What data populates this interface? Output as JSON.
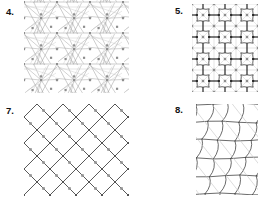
{
  "sheet": {
    "width": 264,
    "height": 197,
    "background": "#ffffff",
    "description": "Four numbered line-drawing tiling pattern figures arranged in a 2x2 grid"
  },
  "colors": {
    "ink": "#3a3a3a",
    "ink_dark": "#1e1e1e",
    "ink_light": "#9a9a9a",
    "ink_faint": "#c4c4c4",
    "dot": "#8e8e8e",
    "dot_dark": "#2a2a2a",
    "label": "#121212",
    "background": "#ffffff"
  },
  "panels": [
    {
      "id": "panel-4",
      "label": "4.",
      "label_x": 6,
      "label_y": 7,
      "figure_x": 24,
      "figure_y": 0,
      "figure_w": 105,
      "figure_h": 93,
      "pattern_type": "triangulated-pinwheel-tiling",
      "period_x": 33,
      "period_y": 31,
      "dot_shape": "square",
      "dot_size": 2.2,
      "notes": "Dense triangulation with pinwheel star vertices, thin light strokes, gray square dots inside larger cells"
    },
    {
      "id": "panel-5",
      "label": "5.",
      "label_x": 175,
      "label_y": 6,
      "figure_x": 192,
      "figure_y": 4,
      "figure_w": 66,
      "figure_h": 88,
      "pattern_type": "scalloped-cross-tiling",
      "period_x": 22,
      "period_y": 22,
      "dot_shape": "square",
      "dot_size": 2.4,
      "notes": "Dark curved scalloped cross tiles over a faint gray square-and-diagonal underlay grid; dark square nodes at cross corners, gray square dots at grid centers"
    },
    {
      "id": "panel-7",
      "label": "7.",
      "label_x": 6,
      "label_y": 106,
      "figure_x": 24,
      "figure_y": 104,
      "figure_w": 105,
      "figure_h": 92,
      "pattern_type": "herringbone-diagonal-tiling",
      "period_x": 26,
      "period_y": 26,
      "dot_shape": "square",
      "dot_size": 2.6,
      "notes": "Herringbone arrangement of diagonal strokes forming chevrons and diamonds, gray square dots centered in cells"
    },
    {
      "id": "panel-8",
      "label": "8.",
      "label_x": 175,
      "label_y": 105,
      "figure_x": 196,
      "figure_y": 104,
      "figure_w": 62,
      "figure_h": 91,
      "pattern_type": "warped-quadrilateral-mesh",
      "period_x": 16,
      "period_y": 18,
      "dot_shape": "none",
      "dot_size": 0,
      "notes": "Irregular curved quadrilateral mesh, slanted columns with wavy vertical strokes, plus faint long diagonal guide lines"
    }
  ]
}
